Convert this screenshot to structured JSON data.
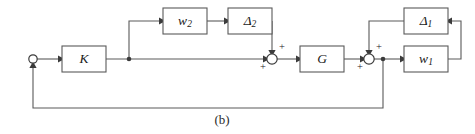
{
  "figure": {
    "kind": "control-block-diagram",
    "caption": "(b)",
    "stroke_color": "#5a5a5a",
    "text_color": "#1a1a1a",
    "background": "#ffffff"
  },
  "blocks": [
    {
      "id": "K",
      "label": "K",
      "sub": "",
      "x": 62,
      "y": 46,
      "w": 44,
      "h": 26
    },
    {
      "id": "w2",
      "label": "w",
      "sub": "2",
      "x": 163,
      "y": 8,
      "w": 44,
      "h": 26
    },
    {
      "id": "d2",
      "label": "Δ",
      "sub": "2",
      "x": 228,
      "y": 8,
      "w": 44,
      "h": 26
    },
    {
      "id": "G",
      "label": "G",
      "sub": "",
      "x": 300,
      "y": 46,
      "w": 44,
      "h": 26
    },
    {
      "id": "d1",
      "label": "Δ",
      "sub": "1",
      "x": 404,
      "y": 8,
      "w": 44,
      "h": 26
    },
    {
      "id": "w1",
      "label": "w",
      "sub": "1",
      "x": 404,
      "y": 46,
      "w": 44,
      "h": 26
    }
  ],
  "junctions": [
    {
      "id": "input-node",
      "type": "open-circle",
      "cx": 33,
      "cy": 59,
      "r": 4.2
    },
    {
      "id": "sum-1",
      "type": "summing",
      "cx": 272,
      "cy": 59,
      "r": 5.2,
      "signs": [
        {
          "text": "+",
          "x": 282,
          "y": 48
        },
        {
          "text": "+",
          "x": 263,
          "y": 68
        }
      ]
    },
    {
      "id": "sum-2",
      "type": "summing",
      "cx": 369,
      "cy": 59,
      "r": 5.2,
      "signs": [
        {
          "text": "+",
          "x": 379,
          "y": 48
        },
        {
          "text": "+",
          "x": 360,
          "y": 68
        }
      ]
    }
  ],
  "branch_points": [
    {
      "id": "tap-after-K",
      "cx": 129,
      "cy": 59
    },
    {
      "id": "tap-after-sum2",
      "cx": 383,
      "cy": 59
    }
  ],
  "signals": [
    {
      "id": "ref-to-K",
      "path": "M 37 59 L 62 59",
      "arrow_at": "end",
      "arrow_x": 58,
      "arrow_y": 59,
      "dir": "right"
    },
    {
      "id": "K-to-sum1",
      "path": "M 106 59 L 267 59",
      "arrow_at": "end",
      "arrow_x": 263,
      "arrow_y": 59,
      "dir": "right"
    },
    {
      "id": "tap-up-to-w2",
      "path": "M 129 59 L 129 21 L 163 21",
      "arrow_at": "end",
      "arrow_x": 159,
      "arrow_y": 21,
      "dir": "right"
    },
    {
      "id": "w2-to-d2",
      "path": "M 207 21 L 228 21",
      "arrow_at": "end",
      "arrow_x": 224,
      "arrow_y": 21,
      "dir": "right"
    },
    {
      "id": "d2-to-sum1",
      "path": "M 272 21 L 272 54",
      "arrow_at": "end",
      "arrow_x": 272,
      "arrow_y": 50,
      "dir": "down"
    },
    {
      "id": "sum1-to-G",
      "path": "M 277 59 L 300 59",
      "arrow_at": "end",
      "arrow_x": 296,
      "arrow_y": 59,
      "dir": "right"
    },
    {
      "id": "G-to-sum2",
      "path": "M 344 59 L 364 59",
      "arrow_at": "end",
      "arrow_x": 360,
      "arrow_y": 59,
      "dir": "right"
    },
    {
      "id": "sum2-to-w1",
      "path": "M 374 59 L 404 59",
      "arrow_at": "end",
      "arrow_x": 400,
      "arrow_y": 59,
      "dir": "right"
    },
    {
      "id": "w1-to-d1",
      "path": "M 448 59 L 461 59 L 461 21 L 448 21",
      "arrow_at": "end",
      "arrow_x": 452,
      "arrow_y": 21,
      "dir": "left"
    },
    {
      "id": "d1-to-sum2",
      "path": "M 404 21 L 369 21 L 369 54",
      "arrow_at": "end",
      "arrow_x": 369,
      "arrow_y": 50,
      "dir": "down"
    },
    {
      "id": "output-feedback",
      "path": "M 383 59 L 383 108 L 33 108 L 33 64",
      "arrow_at": "end",
      "arrow_x": 33,
      "arrow_y": 68,
      "dir": "up"
    }
  ],
  "caption": {
    "text": "(b)",
    "x": 222,
    "y": 121
  }
}
